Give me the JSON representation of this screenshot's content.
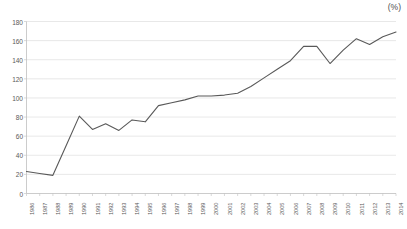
{
  "unit_label": "(%)",
  "colors": {
    "line": "#595959",
    "grid": "#d9d9d9",
    "axis": "#bfbfbf",
    "text": "#595959",
    "background": "#ffffff"
  },
  "chart_data": {
    "type": "line",
    "title": "",
    "subtitle": "",
    "xlabel": "",
    "ylabel": "",
    "unit": "(%)",
    "grid": "horizontal",
    "legend": "none",
    "ylim": [
      0,
      180
    ],
    "yticks": [
      0,
      20,
      40,
      60,
      80,
      100,
      120,
      140,
      160,
      180
    ],
    "categories": [
      "1986",
      "1987",
      "1988",
      "1989",
      "1990",
      "1991",
      "1992",
      "1993",
      "1994",
      "1995",
      "1996",
      "1997",
      "1998",
      "1999",
      "2000",
      "2001",
      "2002",
      "2003",
      "2004",
      "2005",
      "2006",
      "2007",
      "2008",
      "2009",
      "2010",
      "2011",
      "2012",
      "2013",
      "2014"
    ],
    "values": [
      23,
      21,
      19,
      50,
      81,
      67,
      73,
      66,
      77,
      75,
      92,
      95,
      98,
      102,
      102,
      103,
      105,
      112,
      121,
      130,
      139,
      154,
      154,
      136,
      150,
      162,
      156,
      164,
      169
    ],
    "series": [
      {
        "name": "",
        "values": [
          23,
          21,
          19,
          50,
          81,
          67,
          73,
          66,
          77,
          75,
          92,
          95,
          98,
          102,
          102,
          103,
          105,
          112,
          121,
          130,
          139,
          154,
          154,
          136,
          150,
          162,
          156,
          164,
          169
        ]
      }
    ]
  }
}
